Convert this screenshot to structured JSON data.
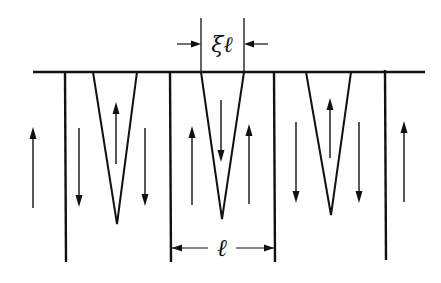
{
  "diagram": {
    "type": "domain-structure",
    "colors": {
      "line": "#111111",
      "background": "#ffffff"
    },
    "labels": {
      "wedge_width": "ξℓ",
      "period": "ℓ"
    },
    "surface_line": {
      "x1": 33,
      "x2": 425,
      "y": 72
    },
    "walls": [
      {
        "x": 65,
        "y1": 72,
        "y2": 262
      },
      {
        "x": 170,
        "y1": 72,
        "y2": 262
      },
      {
        "x": 274,
        "y1": 72,
        "y2": 262
      },
      {
        "x": 385,
        "y1": 70,
        "y2": 260
      }
    ],
    "wedges": [
      {
        "x_left": 93,
        "x_right": 137,
        "apex_x": 117,
        "apex_y": 224
      },
      {
        "x_left": 201,
        "x_right": 244,
        "apex_x": 222,
        "apex_y": 219
      },
      {
        "x_left": 306,
        "x_right": 351,
        "apex_x": 331,
        "apex_y": 215
      }
    ],
    "arrows": [
      {
        "x": 33,
        "y_top": 127,
        "y_bottom": 208,
        "dir": "up"
      },
      {
        "x": 79,
        "y_top": 128,
        "y_bottom": 207,
        "dir": "down"
      },
      {
        "x": 116,
        "y_top": 102,
        "y_bottom": 164,
        "dir": "up"
      },
      {
        "x": 145,
        "y_top": 128,
        "y_bottom": 206,
        "dir": "down"
      },
      {
        "x": 192,
        "y_top": 126,
        "y_bottom": 205,
        "dir": "up"
      },
      {
        "x": 221,
        "y_top": 100,
        "y_bottom": 162,
        "dir": "down"
      },
      {
        "x": 249,
        "y_top": 124,
        "y_bottom": 204,
        "dir": "up"
      },
      {
        "x": 296,
        "y_top": 122,
        "y_bottom": 203,
        "dir": "down"
      },
      {
        "x": 330,
        "y_top": 98,
        "y_bottom": 158,
        "dir": "up"
      },
      {
        "x": 359,
        "y_top": 122,
        "y_bottom": 203,
        "dir": "down"
      },
      {
        "x": 404,
        "y_top": 121,
        "y_bottom": 202,
        "dir": "up"
      }
    ],
    "dimension_wedge": {
      "x_left": 201,
      "x_right": 244,
      "y": 44,
      "tick_top": 18,
      "label_x": 222,
      "label_y": 52
    },
    "dimension_period": {
      "x_left": 172,
      "x_right": 274,
      "y": 248,
      "label_x": 222,
      "label_y": 256
    }
  }
}
